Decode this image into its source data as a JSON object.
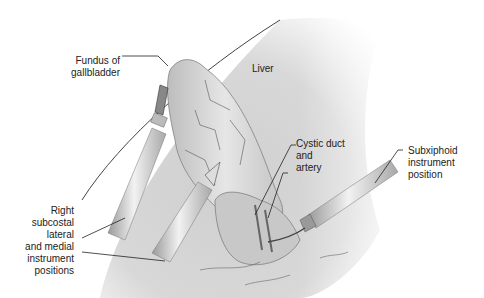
{
  "figure": {
    "type": "medical-illustration"
  },
  "labels": {
    "fundus": [
      "Fundus of",
      "gallbladder"
    ],
    "liver": "Liver",
    "cystic": [
      "Cystic duct",
      "and",
      "artery"
    ],
    "subxiphoid": [
      "Subxiphoid",
      "instrument",
      "position"
    ],
    "subcostal": [
      "Right",
      "subcostal",
      "lateral",
      "and medial",
      "instrument",
      "positions"
    ]
  }
}
